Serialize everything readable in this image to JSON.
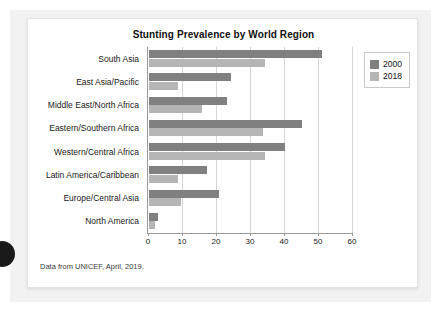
{
  "figure": {
    "title": "Stunting Prevalence by World Region",
    "source_note": "Data from UNICEF, April, 2019."
  },
  "legend": {
    "entries": [
      {
        "label": "2000",
        "color": "#808080"
      },
      {
        "label": "2018",
        "color": "#b5b5b5"
      }
    ]
  },
  "axis": {
    "x_ticks": [
      "0",
      "10",
      "20",
      "30",
      "40",
      "50",
      "60"
    ]
  },
  "chart_data": {
    "type": "bar",
    "orientation": "horizontal",
    "title": "Stunting Prevalence by World Region",
    "xlabel": "",
    "ylabel": "",
    "xlim": [
      0,
      60
    ],
    "xticks": [
      0,
      10,
      20,
      30,
      40,
      50,
      60
    ],
    "grid": true,
    "legend_position": "top-right",
    "categories": [
      "South Asia",
      "East Asia/Pacific",
      "Middle East/North Africa",
      "Eastern/Southern Africa",
      "Western/Central Africa",
      "Latin America/Caribbean",
      "Europe/Central Asia",
      "North America"
    ],
    "series": [
      {
        "name": "2000",
        "color": "#808080",
        "values": [
          51,
          24,
          23,
          45,
          40,
          17,
          20.5,
          2.6
        ]
      },
      {
        "name": "2018",
        "color": "#b5b5b5",
        "values": [
          34,
          8.5,
          15.5,
          33.5,
          34,
          8.5,
          9.5,
          1.8
        ]
      }
    ],
    "annotations": [
      "Data from UNICEF, April, 2019."
    ]
  }
}
